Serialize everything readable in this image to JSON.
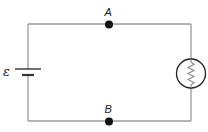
{
  "diagram": {
    "type": "circuit",
    "components": [
      {
        "id": "battery",
        "kind": "emf-source",
        "label": "ε",
        "position": "left"
      },
      {
        "id": "bulb",
        "kind": "light-bulb",
        "position": "right"
      }
    ],
    "nodes": [
      {
        "id": "A",
        "label": "A",
        "position": "top-center"
      },
      {
        "id": "B",
        "label": "B",
        "position": "bottom-center"
      }
    ],
    "colors": {
      "wire": "#9a9a9a",
      "node": "#111111",
      "component": "#222222"
    }
  }
}
